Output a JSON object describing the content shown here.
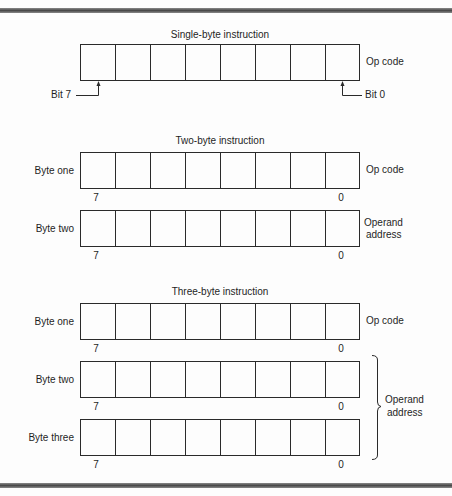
{
  "frame": {
    "border_color": "#5a5a5a"
  },
  "diagram": {
    "bits_per_byte": 8,
    "sections": [
      {
        "title": "Single-byte instruction",
        "registers": [
          {
            "label": "",
            "side_label": [
              "Op code"
            ]
          }
        ],
        "bit_annotations": {
          "left": "Bit 7",
          "right": "Bit 0"
        }
      },
      {
        "title": "Two-byte instruction",
        "registers": [
          {
            "label": "Byte one",
            "side_label": [
              "Op code"
            ],
            "msb": "7",
            "lsb": "0"
          },
          {
            "label": "Byte two",
            "side_label": [
              "Operand",
              "address"
            ],
            "msb": "7",
            "lsb": "0"
          }
        ]
      },
      {
        "title": "Three-byte instruction",
        "registers": [
          {
            "label": "Byte one",
            "side_label": [
              "Op code"
            ],
            "msb": "7",
            "lsb": "0"
          },
          {
            "label": "Byte two",
            "msb": "7",
            "lsb": "0"
          },
          {
            "label": "Byte three",
            "msb": "7",
            "lsb": "0"
          }
        ],
        "brace_label": [
          "Operand",
          "address"
        ]
      }
    ]
  }
}
